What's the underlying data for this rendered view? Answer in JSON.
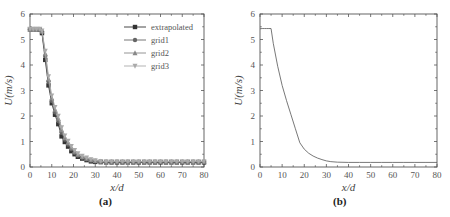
{
  "chart_data": [
    {
      "type": "line",
      "caption": "(a)",
      "title": "",
      "xlabel": "x/d",
      "ylabel": "U(m/s)",
      "xlim": [
        0,
        80
      ],
      "ylim": [
        0,
        6
      ],
      "xticks": [
        0,
        10,
        20,
        30,
        40,
        50,
        60,
        70,
        80
      ],
      "yticks": [
        0,
        1,
        2,
        3,
        4,
        5,
        6
      ],
      "grid": false,
      "legend_position": "upper right",
      "x": [
        0,
        1.5,
        3,
        4.5,
        5.5,
        7,
        8.5,
        10,
        11.5,
        13,
        14.5,
        16,
        17.5,
        19,
        20.5,
        22,
        24,
        26,
        28,
        30,
        32.5,
        35,
        37.5,
        40,
        42.5,
        45,
        47.5,
        50,
        52.5,
        55,
        57.5,
        60,
        62.5,
        65,
        67.5,
        70,
        72.5,
        75,
        77.5,
        80
      ],
      "series": [
        {
          "name": "extrapolated",
          "marker": "square",
          "color": "#333333",
          "values": [
            5.4,
            5.4,
            5.4,
            5.38,
            5.25,
            4.2,
            3.2,
            2.5,
            2.05,
            1.68,
            1.2,
            0.98,
            0.8,
            0.62,
            0.5,
            0.4,
            0.33,
            0.27,
            0.22,
            0.2,
            0.19,
            0.18,
            0.18,
            0.18,
            0.18,
            0.18,
            0.18,
            0.18,
            0.18,
            0.18,
            0.18,
            0.18,
            0.18,
            0.18,
            0.18,
            0.18,
            0.18,
            0.18,
            0.18,
            0.18
          ]
        },
        {
          "name": "grid1",
          "marker": "circle",
          "color": "#666666",
          "values": [
            5.4,
            5.4,
            5.4,
            5.39,
            5.3,
            4.35,
            3.35,
            2.6,
            2.15,
            1.8,
            1.35,
            1.08,
            0.88,
            0.7,
            0.56,
            0.45,
            0.36,
            0.3,
            0.25,
            0.22,
            0.2,
            0.2,
            0.2,
            0.2,
            0.2,
            0.2,
            0.2,
            0.2,
            0.2,
            0.2,
            0.2,
            0.2,
            0.2,
            0.2,
            0.2,
            0.2,
            0.2,
            0.2,
            0.2,
            0.2
          ]
        },
        {
          "name": "grid2",
          "marker": "triangle",
          "color": "#888888",
          "values": [
            5.4,
            5.4,
            5.4,
            5.4,
            5.32,
            4.45,
            3.45,
            2.7,
            2.25,
            1.9,
            1.45,
            1.15,
            0.95,
            0.76,
            0.61,
            0.49,
            0.4,
            0.33,
            0.28,
            0.24,
            0.22,
            0.21,
            0.21,
            0.21,
            0.21,
            0.21,
            0.21,
            0.21,
            0.21,
            0.21,
            0.21,
            0.21,
            0.21,
            0.21,
            0.21,
            0.21,
            0.21,
            0.21,
            0.21,
            0.21
          ]
        },
        {
          "name": "grid3",
          "marker": "down-triangle",
          "color": "#aaaaaa",
          "values": [
            5.41,
            5.41,
            5.41,
            5.41,
            5.35,
            4.55,
            3.55,
            2.8,
            2.35,
            2.0,
            1.55,
            1.23,
            1.02,
            0.82,
            0.66,
            0.53,
            0.43,
            0.36,
            0.3,
            0.26,
            0.23,
            0.22,
            0.22,
            0.22,
            0.22,
            0.22,
            0.22,
            0.22,
            0.22,
            0.22,
            0.22,
            0.22,
            0.22,
            0.22,
            0.22,
            0.22,
            0.22,
            0.22,
            0.22,
            0.22
          ]
        }
      ]
    },
    {
      "type": "line",
      "caption": "(b)",
      "title": "",
      "xlabel": "x/d",
      "ylabel": "U(m/s)",
      "xlim": [
        0,
        80
      ],
      "ylim": [
        0,
        6
      ],
      "xticks": [
        0,
        10,
        20,
        30,
        40,
        50,
        60,
        70,
        80
      ],
      "yticks": [
        0,
        1,
        2,
        3,
        4,
        5,
        6
      ],
      "grid": false,
      "x": [
        0,
        1,
        2,
        3,
        4,
        5,
        6,
        8,
        10,
        12,
        14,
        16,
        18,
        20,
        22,
        24,
        26,
        28,
        30,
        32,
        35,
        40,
        45,
        50,
        55,
        60,
        65,
        70,
        75,
        80
      ],
      "series": [
        {
          "name": "U",
          "color": "#555555",
          "values": [
            5.42,
            5.43,
            5.43,
            5.43,
            5.43,
            5.43,
            4.85,
            3.95,
            3.2,
            2.6,
            2.05,
            1.5,
            0.95,
            0.7,
            0.54,
            0.43,
            0.35,
            0.29,
            0.24,
            0.21,
            0.19,
            0.18,
            0.18,
            0.18,
            0.18,
            0.18,
            0.18,
            0.18,
            0.18,
            0.18
          ]
        }
      ]
    }
  ]
}
